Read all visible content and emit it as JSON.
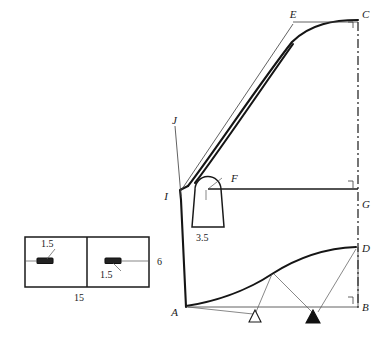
{
  "figure": {
    "background_color": "#ffffff",
    "line_color": "#1a1a1a"
  },
  "left_view": {
    "name": "plan-view-rectangle",
    "dimensions": {
      "width_label": "15",
      "height_label": "6",
      "slot_left_label": "1.5",
      "slot_right_label": "1.5"
    },
    "features": [
      {
        "name": "left-slot",
        "label": "1.5"
      },
      {
        "name": "right-slot",
        "label": "1.5"
      },
      {
        "name": "center-divider",
        "label": ""
      }
    ]
  },
  "right_view": {
    "name": "profile-view-section",
    "points": [
      {
        "id": "A",
        "label": "A",
        "x": 186,
        "y": 312
      },
      {
        "id": "B",
        "label": "B",
        "x": 369,
        "y": 312
      },
      {
        "id": "C",
        "label": "C",
        "x": 362,
        "y": 18
      },
      {
        "id": "D",
        "label": "D",
        "x": 369,
        "y": 250
      },
      {
        "id": "E",
        "label": "E",
        "x": 293,
        "y": 18
      },
      {
        "id": "F",
        "label": "F",
        "x": 231,
        "y": 182
      },
      {
        "id": "G",
        "label": "G",
        "x": 372,
        "y": 205
      },
      {
        "id": "I",
        "label": "I",
        "x": 170,
        "y": 196
      },
      {
        "id": "J",
        "label": "J",
        "x": 172,
        "y": 121
      }
    ],
    "dimensions": {
      "boss_width_label": "3.5"
    },
    "markers": [
      {
        "name": "open-triangle-support",
        "type": "open",
        "label": ""
      },
      {
        "name": "filled-triangle-support",
        "type": "filled",
        "label": ""
      }
    ]
  }
}
